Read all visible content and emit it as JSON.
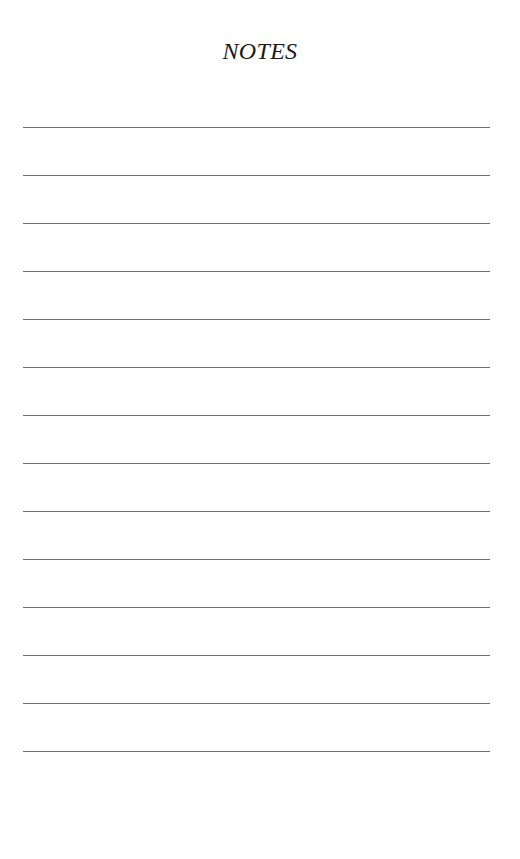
{
  "page": {
    "title": "NOTES",
    "line_count": 14,
    "line_color": "#6e6e6e"
  }
}
